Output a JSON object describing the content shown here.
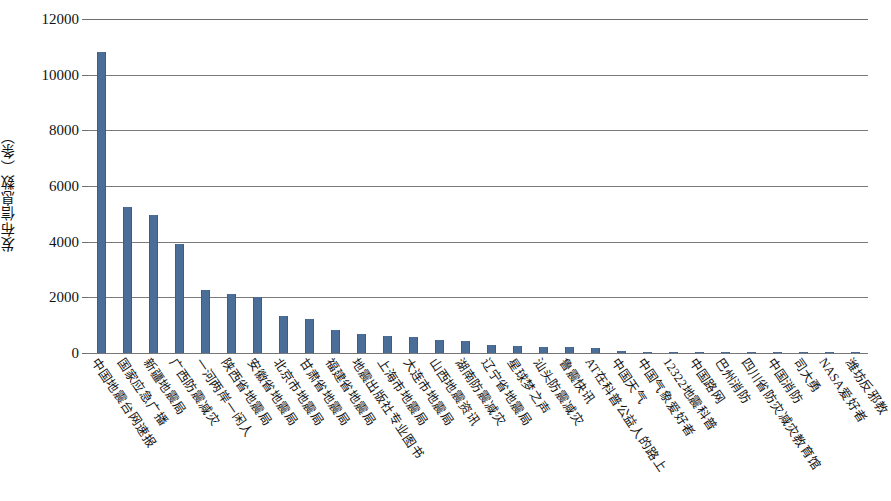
{
  "chart_data": {
    "type": "bar",
    "title": "",
    "xlabel": "",
    "ylabel": "发布信息数（条）",
    "ylim": [
      0,
      12000
    ],
    "ytick_labels": [
      "0",
      "2000",
      "4000",
      "6000",
      "8000",
      "10000",
      "12000"
    ],
    "ytick_values": [
      0,
      2000,
      4000,
      6000,
      8000,
      10000,
      12000
    ],
    "grid": true,
    "legend": "none",
    "bar_color": "#4a6e97",
    "categories": [
      "中国地震台网速报",
      "国家应急广播",
      "新疆地震局",
      "广西防震减灾",
      "一河两岸一闲人",
      "陕西省地震局",
      "安徽省地震局",
      "北京市地震局",
      "甘肃省地震局",
      "福建省地震局",
      "地震出版社专业图书",
      "上海市地震局",
      "大连市地震局",
      "山西地震资讯",
      "湖南防震减灾",
      "辽宁省地震局",
      "星球梦之声",
      "汕头防震减灾",
      "鲁震快讯",
      "AT在科普公益人的路上",
      "中国天气",
      "中国气象爱好者",
      "12322地震科普",
      "中国路网",
      "巴州消防",
      "四川省防灾减灾教育馆",
      "中国消防",
      "司大勇",
      "NASA爱好者",
      "潍坊反邪教"
    ],
    "values": [
      10800,
      5230,
      4950,
      3900,
      2250,
      2120,
      2000,
      1320,
      1210,
      830,
      690,
      620,
      560,
      480,
      420,
      300,
      250,
      210,
      200,
      190,
      60,
      45,
      40,
      35,
      30,
      25,
      20,
      18,
      15,
      12
    ]
  }
}
